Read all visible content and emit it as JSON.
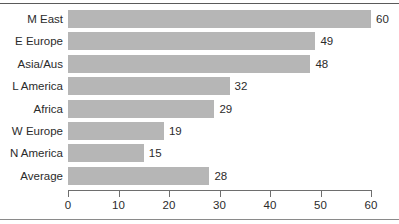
{
  "chart_data": {
    "type": "bar",
    "orientation": "horizontal",
    "title": "",
    "subtitle": "",
    "xlabel": "",
    "ylabel": "",
    "xlim": [
      0,
      60
    ],
    "xticks": [
      0,
      10,
      20,
      30,
      40,
      50,
      60
    ],
    "grid": false,
    "legend": false,
    "bar_color": "#b6b6b6",
    "categories": [
      "M East",
      "E Europe",
      "Asia/Aus",
      "L America",
      "Africa",
      "W Europe",
      "N America",
      "Average"
    ],
    "values": [
      60,
      49,
      48,
      32,
      29,
      19,
      15,
      28
    ],
    "data_labels": [
      "60",
      "49",
      "48",
      "32",
      "29",
      "19",
      "15",
      "28"
    ]
  },
  "axis": {
    "tick_labels": [
      "0",
      "10",
      "20",
      "30",
      "40",
      "50",
      "60"
    ]
  },
  "rows": [
    {
      "label": "M East",
      "value": 60,
      "label_text": "60"
    },
    {
      "label": "E Europe",
      "value": 49,
      "label_text": "49"
    },
    {
      "label": "Asia/Aus",
      "value": 48,
      "label_text": "48"
    },
    {
      "label": "L America",
      "value": 32,
      "label_text": "32"
    },
    {
      "label": "Africa",
      "value": 29,
      "label_text": "29"
    },
    {
      "label": "W Europe",
      "value": 19,
      "label_text": "19"
    },
    {
      "label": "N America",
      "value": 15,
      "label_text": "15"
    },
    {
      "label": "Average",
      "value": 28,
      "label_text": "28"
    }
  ]
}
